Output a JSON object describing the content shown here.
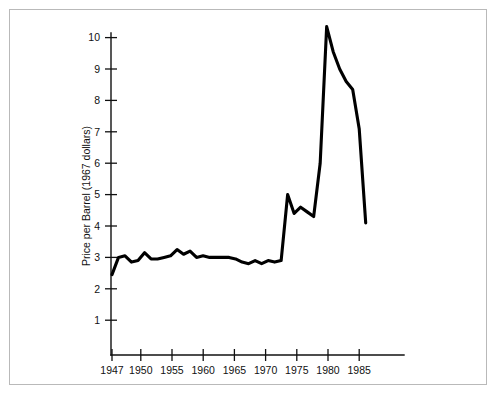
{
  "figure": {
    "background_color": "#ffffff",
    "border_color": "#b9b9b9",
    "line_color": "#000000"
  },
  "axes": {
    "y_title": "Price per Barrel (1967 dollars)",
    "x_title": "",
    "y_ticks": [
      "1",
      "2",
      "3",
      "4",
      "5",
      "6",
      "7",
      "8",
      "9",
      "10"
    ],
    "x_ticks": [
      "1947",
      "1950",
      "1955",
      "1960",
      "1965",
      "1970",
      "1975",
      "1980",
      "1985"
    ]
  },
  "chart_data": {
    "type": "line",
    "title": "",
    "xlabel": "",
    "ylabel": "Price per Barrel (1967 dollars)",
    "xlim": [
      1947,
      1987
    ],
    "ylim": [
      0,
      10.8
    ],
    "grid": false,
    "legend": null,
    "x_tick_values": [
      1947,
      1950,
      1955,
      1960,
      1965,
      1970,
      1975,
      1980,
      1985
    ],
    "y_tick_values": [
      1,
      2,
      3,
      4,
      5,
      6,
      7,
      8,
      9,
      10
    ],
    "series": [
      {
        "name": "Real crude oil price",
        "x": [
          1947,
          1948,
          1949,
          1950,
          1951,
          1952,
          1953,
          1954,
          1955,
          1956,
          1957,
          1958,
          1959,
          1960,
          1961,
          1962,
          1963,
          1964,
          1965,
          1966,
          1967,
          1968,
          1969,
          1970,
          1971,
          1972,
          1973,
          1974,
          1975,
          1976,
          1977,
          1978,
          1979,
          1980,
          1981,
          1982,
          1983,
          1984,
          1985,
          1986
        ],
        "values": [
          2.45,
          3.0,
          3.05,
          2.85,
          2.9,
          3.15,
          2.95,
          2.95,
          3.0,
          3.05,
          3.25,
          3.1,
          3.2,
          3.0,
          3.05,
          3.0,
          3.0,
          3.0,
          3.0,
          2.95,
          2.85,
          2.8,
          2.9,
          2.8,
          2.9,
          2.85,
          2.9,
          5.0,
          4.4,
          4.6,
          4.45,
          4.3,
          6.0,
          10.35,
          9.55,
          9.0,
          8.6,
          8.35,
          7.1,
          4.1
        ]
      }
    ]
  }
}
